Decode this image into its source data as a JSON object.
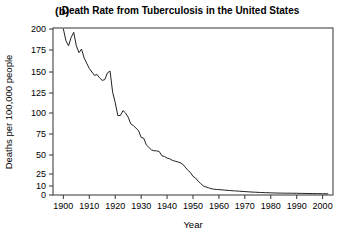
{
  "panel": {
    "label": "(b)"
  },
  "chart_data": {
    "type": "line",
    "title": "Death Rate from Tuberculosis in the United States",
    "xlabel": "Year",
    "ylabel": "Deaths per 100,000 people",
    "xlim": [
      1896,
      2004
    ],
    "ylim": [
      0,
      200
    ],
    "grid": false,
    "legend": false,
    "xticks": [
      1900,
      1910,
      1920,
      1930,
      1940,
      1950,
      1960,
      1970,
      1980,
      1990,
      2000
    ],
    "xticklabels": [
      "1900",
      "1910",
      "1920",
      "1930",
      "1940",
      "1950",
      "1960",
      "1970",
      "1980",
      "1990",
      "2000"
    ],
    "yticks": [
      0,
      10,
      25,
      50,
      75,
      100,
      125,
      150,
      175,
      200
    ],
    "yticklabels": [
      "0",
      "10",
      "25",
      "50",
      "75",
      "100",
      "125",
      "150",
      "175",
      "200"
    ],
    "y_axis_note": "non-uniform spacing between 0, 10 and 25",
    "line_color": "#222222",
    "x": [
      1900,
      1901,
      1902,
      1903,
      1904,
      1905,
      1906,
      1907,
      1908,
      1909,
      1910,
      1911,
      1912,
      1913,
      1914,
      1915,
      1916,
      1917,
      1918,
      1919,
      1920,
      1921,
      1922,
      1923,
      1924,
      1925,
      1926,
      1927,
      1928,
      1929,
      1930,
      1931,
      1932,
      1933,
      1934,
      1935,
      1936,
      1937,
      1938,
      1939,
      1940,
      1941,
      1942,
      1943,
      1944,
      1945,
      1946,
      1947,
      1948,
      1949,
      1950,
      1951,
      1952,
      1953,
      1954,
      1955,
      1956,
      1957,
      1958,
      1959,
      1960,
      1962,
      1964,
      1966,
      1968,
      1970,
      1972,
      1974,
      1976,
      1978,
      1980,
      1982,
      1984,
      1986,
      1988,
      1990,
      1992,
      1994,
      1996,
      1998,
      2000,
      2002
    ],
    "values": [
      200,
      186,
      180,
      190,
      196,
      180,
      172,
      176,
      166,
      160,
      154,
      150,
      146,
      147,
      143,
      140,
      141,
      149,
      151,
      126,
      113,
      97,
      97,
      103,
      100,
      95,
      87,
      85,
      82,
      79,
      71,
      70,
      62,
      59,
      56,
      55,
      55,
      54,
      49,
      48,
      46,
      45,
      43,
      42,
      41,
      40,
      38,
      34,
      30,
      27,
      22,
      20,
      16,
      13,
      10,
      9,
      8,
      7,
      6.5,
      6.2,
      6,
      5.5,
      5,
      4.6,
      4.2,
      3.8,
      3.4,
      3.1,
      2.8,
      2.6,
      2.4,
      2.2,
      2.1,
      2.0,
      2.0,
      1.9,
      1.8,
      1.7,
      1.6,
      1.5,
      1.4,
      1.3
    ]
  }
}
